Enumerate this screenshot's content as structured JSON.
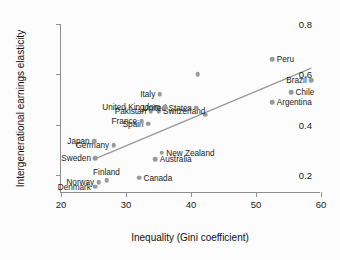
{
  "chart_data": {
    "type": "scatter",
    "title": "",
    "xlabel": "Inequality (Gini coefficient)",
    "ylabel": "Intergenerational earnings elasticity",
    "xlim": [
      20,
      60
    ],
    "ylim": [
      0.13,
      0.8
    ],
    "xticks": [
      "20",
      "30",
      "40",
      "50",
      "60"
    ],
    "xtick_values": [
      20,
      30,
      40,
      50,
      60
    ],
    "yticks": [
      "0.2",
      "0.4",
      "0.6",
      "0.8"
    ],
    "ytick_values": [
      0.2,
      0.4,
      0.6,
      0.8
    ],
    "grid": false,
    "legend": "none",
    "marker_color": "#9a9a9a",
    "trendline_color": "#9a9a9a",
    "axis_color": "#8d8d8d",
    "trendline": {
      "x0": 25.4,
      "y0": 0.267,
      "x1": 58.5,
      "y1": 0.625
    },
    "points": [
      {
        "label": "Denmark",
        "x": 25.3,
        "y": 0.155,
        "side": "left"
      },
      {
        "label": "Norway",
        "x": 25.8,
        "y": 0.172,
        "side": "left"
      },
      {
        "label": "Finland",
        "x": 27.0,
        "y": 0.18,
        "side": "above"
      },
      {
        "label": "Canada",
        "x": 32.0,
        "y": 0.19,
        "side": "right"
      },
      {
        "label": "Australia",
        "x": 34.5,
        "y": 0.265,
        "side": "right"
      },
      {
        "label": "Sweden",
        "x": 25.3,
        "y": 0.268,
        "side": "left"
      },
      {
        "label": "New Zealand",
        "x": 35.5,
        "y": 0.29,
        "side": "right"
      },
      {
        "label": "Germany",
        "x": 28.1,
        "y": 0.32,
        "side": "left"
      },
      {
        "label": "Japan",
        "x": 25.1,
        "y": 0.336,
        "side": "left"
      },
      {
        "label": "Spain",
        "x": 33.4,
        "y": 0.405,
        "side": "left"
      },
      {
        "label": "France",
        "x": 32.4,
        "y": 0.415,
        "side": "left"
      },
      {
        "label": "",
        "x": 42.2,
        "y": 0.44,
        "side": "none"
      },
      {
        "label": "Pakistan",
        "x": 33.8,
        "y": 0.455,
        "side": "left"
      },
      {
        "label": "Switzerland",
        "x": 35.0,
        "y": 0.455,
        "side": "right"
      },
      {
        "label": "United States",
        "x": 40.8,
        "y": 0.468,
        "side": "left"
      },
      {
        "label": "United Kingdom",
        "x": 36.0,
        "y": 0.47,
        "side": "left"
      },
      {
        "label": "Italy",
        "x": 35.2,
        "y": 0.522,
        "side": "left"
      },
      {
        "label": "Argentina",
        "x": 52.5,
        "y": 0.49,
        "side": "right"
      },
      {
        "label": "Chile",
        "x": 55.4,
        "y": 0.53,
        "side": "right"
      },
      {
        "label": "Brazil",
        "x": 58.5,
        "y": 0.578,
        "side": "left"
      },
      {
        "label": "",
        "x": 41.0,
        "y": 0.6,
        "side": "none"
      },
      {
        "label": "Peru",
        "x": 52.5,
        "y": 0.66,
        "side": "right"
      }
    ]
  }
}
